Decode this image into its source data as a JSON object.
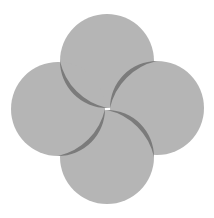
{
  "figure": {
    "background": "#ffffff",
    "circle_fill": "#b5b5b5",
    "crescent_fill": "#7b7b7b",
    "radius": 47,
    "circles": [
      {
        "name": "top",
        "cx": 107,
        "cy": 61
      },
      {
        "name": "right",
        "cx": 157,
        "cy": 108
      },
      {
        "name": "bottom",
        "cx": 107,
        "cy": 157
      },
      {
        "name": "left",
        "cx": 58,
        "cy": 109
      }
    ]
  }
}
